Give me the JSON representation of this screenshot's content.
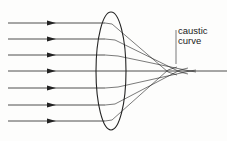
{
  "diagram": {
    "label_line1": "caustic",
    "label_line2": "curve",
    "ray_count": 7,
    "ray_y": [
      23,
      39,
      55,
      71,
      88,
      105,
      121
    ],
    "colors": {
      "line": "#222222",
      "background": "#fdfdfc"
    }
  }
}
